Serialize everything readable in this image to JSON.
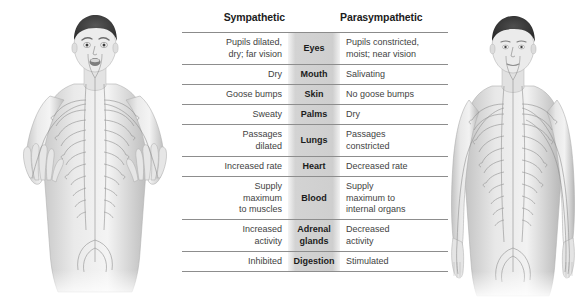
{
  "figures": {
    "left": {
      "name": "sympathetic-nervous-system-figure",
      "alt": "Illustration of an alert, startled man with raised hands showing sympathetic nervous system pathways"
    },
    "right": {
      "name": "parasympathetic-nervous-system-figure",
      "alt": "Illustration of a calm, relaxed man with arms at his sides showing parasympathetic nervous system pathways"
    }
  },
  "table": {
    "headers": {
      "sympathetic": "Sympathetic",
      "organ": "",
      "parasympathetic": "Parasympathetic"
    },
    "rows": [
      {
        "organ": "Eyes",
        "sympathetic": [
          "Pupils dilated,",
          "dry; far vision"
        ],
        "parasympathetic": [
          "Pupils constricted,",
          "moist; near vision"
        ]
      },
      {
        "organ": "Mouth",
        "sympathetic": [
          "Dry"
        ],
        "parasympathetic": [
          "Salivating"
        ]
      },
      {
        "organ": "Skin",
        "sympathetic": [
          "Goose bumps"
        ],
        "parasympathetic": [
          "No goose bumps"
        ]
      },
      {
        "organ": "Palms",
        "sympathetic": [
          "Sweaty"
        ],
        "parasympathetic": [
          "Dry"
        ]
      },
      {
        "organ": "Lungs",
        "sympathetic": [
          "Passages",
          "dilated"
        ],
        "parasympathetic": [
          "Passages",
          "constricted"
        ]
      },
      {
        "organ": "Heart",
        "sympathetic": [
          "Increased rate"
        ],
        "parasympathetic": [
          "Decreased rate"
        ]
      },
      {
        "organ": "Blood",
        "sympathetic": [
          "Supply",
          "maximum",
          "to muscles"
        ],
        "parasympathetic": [
          "Supply",
          "maximum to",
          "internal organs"
        ]
      },
      {
        "organ": "Adrenal glands",
        "organ_lines": [
          "Adrenal",
          "glands"
        ],
        "sympathetic": [
          "Increased",
          "activity"
        ],
        "parasympathetic": [
          "Decreased",
          "activity"
        ]
      },
      {
        "organ": "Digestion",
        "sympathetic": [
          "Inhibited"
        ],
        "parasympathetic": [
          "Stimulated"
        ]
      }
    ]
  },
  "colors": {
    "rule": "#8d8d8d",
    "text": "#424242",
    "heading": "#1c1c1c",
    "band": "#969696",
    "background": "#ffffff"
  }
}
